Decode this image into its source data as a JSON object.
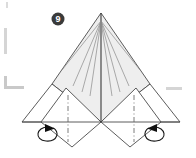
{
  "figure": {
    "kind": "origami-fold-diagram",
    "step_number": "9",
    "background_color": "#ffffff",
    "line_color": "#4a4a4a",
    "shaded_fill": "#eeeeee",
    "badge_fill": "#3a3a3a",
    "badge_text_color": "#ffffff",
    "crop_mark_color": "#d5d5d5"
  },
  "badge": {
    "label": "9",
    "cx": 58,
    "cy": 19,
    "r": 6.5
  },
  "geometry": {
    "apex": [
      101,
      13
    ],
    "center": [
      101,
      122
    ],
    "shade_left": [
      52,
      84
    ],
    "shade_right": [
      150,
      84
    ],
    "wing_left_tip": [
      22,
      122
    ],
    "wing_right_tip": [
      180,
      122
    ],
    "flap_left_bottom": [
      72,
      147
    ],
    "flap_right_bottom": [
      130,
      147
    ],
    "flap_left_top": [
      66,
      88
    ],
    "flap_right_top": [
      136,
      88
    ],
    "fan_lines_per_side": 4
  },
  "shaded_panel": {
    "name": "main-shaded-triangle",
    "points": "101,13 150,84 101,122 52,84",
    "fill": "#eeeeee"
  },
  "annotations": {
    "left_arrow_label": "fold-arrow-left",
    "right_arrow_label": "fold-arrow-right",
    "dash_dot_left_label": "valley-crease-left",
    "dash_dot_right_label": "valley-crease-right",
    "arrow_direction_left": "outward-right",
    "arrow_direction_right": "outward-left"
  },
  "crop_marks": [
    {
      "name": "crop-mark-top-left-tick",
      "x": 6,
      "y": 2,
      "w": 2,
      "h": 6
    },
    {
      "name": "crop-mark-left-vertical",
      "x": 4,
      "y": 28,
      "w": 3,
      "h": 26
    },
    {
      "name": "crop-mark-left-corner-vertical",
      "x": 4,
      "y": 76,
      "w": 3,
      "h": 13
    },
    {
      "name": "crop-mark-left-corner-horizontal",
      "x": 4,
      "y": 86,
      "w": 20,
      "h": 3
    },
    {
      "name": "crop-mark-right-dash",
      "x": 166,
      "y": 87,
      "w": 16,
      "h": 3
    }
  ]
}
